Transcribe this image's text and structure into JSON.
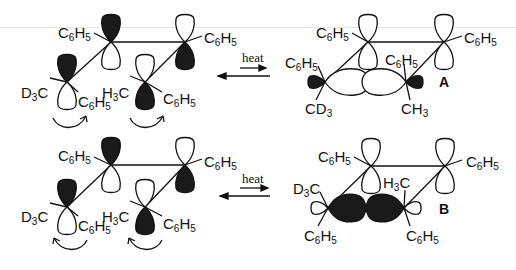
{
  "diagram": {
    "type": "orbital-rearrangement-scheme",
    "rows": [
      {
        "id": "top",
        "reactant": {
          "substituents": {
            "c1_left": "C6H5",
            "c2_right": "C6H5",
            "c3_left": "D3C",
            "c3_right": "C6H5",
            "c4_left": "H3C",
            "c4_right": "C6H5"
          },
          "rotation": "conrotatory-clockwise"
        },
        "arrow_label": "heat",
        "product": {
          "label": "A",
          "substituents": {
            "c1_left": "C6H5",
            "c2_right": "C6H5",
            "c3_top": "C6H5",
            "c3_bottom": "CD3",
            "c4_top": "C6H5",
            "c4_bottom": "CH3"
          }
        }
      },
      {
        "id": "bottom",
        "reactant": {
          "substituents": {
            "c1_left": "C6H5",
            "c2_right": "C6H5",
            "c3_left": "D3C",
            "c3_right": "C6H5",
            "c4_left": "H3C",
            "c4_right": "C6H5"
          },
          "rotation": "conrotatory-counterclockwise"
        },
        "arrow_label": "heat",
        "product": {
          "label": "B",
          "substituents": {
            "c1_left": "C6H5",
            "c2_right": "C6H5",
            "c3_top": "D3C",
            "c3_bottom": "C6H5",
            "c4_top": "H3C",
            "c4_bottom": "C6H5"
          }
        }
      }
    ],
    "colors": {
      "ink": "#111111",
      "shaded_lobe": "#1a1a1a",
      "open_lobe": "#ffffff"
    }
  },
  "labels": {
    "r1": {
      "c1": [
        "C",
        "6",
        "H",
        "5"
      ],
      "c2": [
        "C",
        "6",
        "H",
        "5"
      ],
      "c3l": [
        "D",
        "3",
        "C"
      ],
      "c3r": [
        "C",
        "6",
        "H",
        "5"
      ],
      "c4l": [
        "H",
        "3",
        "C"
      ],
      "c4r": [
        "C",
        "6",
        "H",
        "5"
      ]
    },
    "p1": {
      "c1": [
        "C",
        "6",
        "H",
        "5"
      ],
      "c2": [
        "C",
        "6",
        "H",
        "5"
      ],
      "c3t": [
        "C",
        "6",
        "H",
        "5"
      ],
      "c3b": [
        "CD",
        "3"
      ],
      "c4t": [
        "C",
        "6",
        "H",
        "5"
      ],
      "c4b": [
        "CH",
        "3"
      ],
      "tag": "A"
    },
    "r2": {
      "c1": [
        "C",
        "6",
        "H",
        "5"
      ],
      "c2": [
        "C",
        "6",
        "H",
        "5"
      ],
      "c3l": [
        "D",
        "3",
        "C"
      ],
      "c3r": [
        "C",
        "6",
        "H",
        "5"
      ],
      "c4l": [
        "H",
        "3",
        "C"
      ],
      "c4r": [
        "C",
        "6",
        "H",
        "5"
      ]
    },
    "p2": {
      "c1": [
        "C",
        "6",
        "H",
        "5"
      ],
      "c2": [
        "C",
        "6",
        "H",
        "5"
      ],
      "c3t": [
        "D",
        "3",
        "C"
      ],
      "c3b": [
        "C",
        "6",
        "H",
        "5"
      ],
      "c4t": [
        "H",
        "3",
        "C"
      ],
      "c4b": [
        "C",
        "6",
        "H",
        "5"
      ],
      "tag": "B"
    },
    "heat1": "heat",
    "heat2": "heat"
  }
}
